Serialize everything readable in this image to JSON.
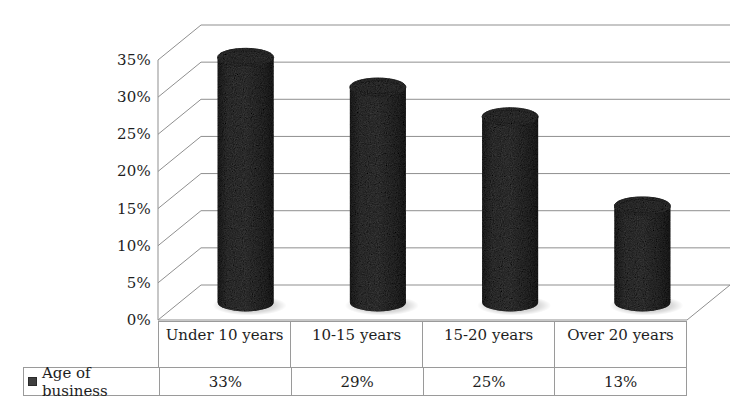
{
  "figure": {
    "background": "#ffffff"
  },
  "chart_data": {
    "type": "bar",
    "subtype": "3d-cylinder",
    "title": "",
    "xlabel": "",
    "ylabel": "",
    "categories": [
      "Under 10 years",
      "10-15 years",
      "15-20 years",
      "Over 20 years"
    ],
    "series": [
      {
        "name": "Age of business",
        "values": [
          33,
          29,
          25,
          13
        ]
      }
    ],
    "value_labels": [
      "33%",
      "29%",
      "25%",
      "13%"
    ],
    "y_tick_labels": [
      "0%",
      "5%",
      "10%",
      "15%",
      "20%",
      "25%",
      "30%",
      "35%"
    ],
    "ylim": [
      0,
      35
    ],
    "y_tick_step": 5,
    "grid": true,
    "legend_position": "bottom-left-table",
    "data_table_shown": true,
    "bar_color": "#3f3f3f",
    "gridline_color": "#8f8f8f",
    "border_color": "#9a9a9a",
    "text_color": "#1e1e1e"
  }
}
